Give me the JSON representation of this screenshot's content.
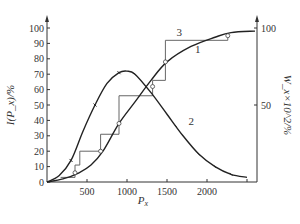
{
  "chart_data": {
    "type": "line",
    "title": "",
    "xlabel": "P_x",
    "ylabel_left": "I(P_x)/%",
    "ylabel_right": "W_x×10^2/%",
    "xlim": [
      0,
      2600
    ],
    "ylim_left": [
      0,
      100
    ],
    "ylim_right": [
      0,
      100
    ],
    "x_ticks": [
      500,
      1000,
      1500,
      2000,
      2500
    ],
    "x_tick_labels": [
      "500",
      "1000",
      "1500",
      "2000",
      ""
    ],
    "y_left_ticks": [
      0,
      10,
      20,
      30,
      40,
      50,
      60,
      70,
      80,
      90,
      100
    ],
    "y_right_ticks": [
      50,
      100
    ],
    "grid": false,
    "legend": "curve number labels placed on curves",
    "series": [
      {
        "name": "1",
        "description": "cumulative curve (smooth, with circle markers)",
        "x": [
          0,
          200,
          400,
          550,
          700,
          900,
          1100,
          1300,
          1500,
          1800,
          2100,
          2300,
          2600
        ],
        "y": [
          0,
          2,
          6,
          11,
          20,
          38,
          52,
          66,
          78,
          88,
          94,
          97,
          98
        ]
      },
      {
        "name": "2",
        "description": "frequency curve (bell-shaped, right axis, tick markers)",
        "x": [
          0,
          150,
          300,
          450,
          600,
          750,
          900,
          1000,
          1100,
          1300,
          1500,
          1700,
          1900,
          2100,
          2300,
          2500
        ],
        "y": [
          0,
          4,
          14,
          33,
          50,
          64,
          71,
          72,
          70,
          58,
          44,
          30,
          18,
          10,
          5,
          3
        ]
      },
      {
        "name": "3",
        "description": "staircase cumulative histogram",
        "x": [
          170,
          350,
          350,
          410,
          410,
          670,
          670,
          900,
          900,
          1320,
          1320,
          1480,
          1480,
          2260,
          2260
        ],
        "y": [
          3,
          3,
          11,
          11,
          20,
          20,
          31,
          31,
          56,
          56,
          66,
          66,
          92,
          92,
          96
        ]
      }
    ],
    "annotations": [
      {
        "text": "1",
        "x": 1850,
        "y": 84
      },
      {
        "text": "2",
        "x": 1770,
        "y": 37
      },
      {
        "text": "3",
        "x": 1620,
        "y": 95
      }
    ]
  }
}
